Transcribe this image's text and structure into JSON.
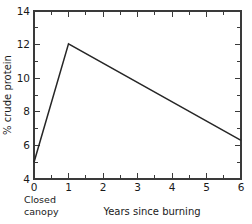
{
  "chart_data": {
    "type": "line",
    "title": "",
    "xlabel": "Years since burning",
    "ylabel": "% crude protein",
    "xlim": [
      0,
      6
    ],
    "ylim": [
      4,
      14
    ],
    "grid": false,
    "legend": null,
    "x": [
      0,
      1,
      6
    ],
    "values": [
      5.0,
      12.05,
      6.3
    ],
    "series": [
      {
        "name": "% crude protein",
        "points": [
          {
            "x": 0,
            "y": 5.0
          },
          {
            "x": 1,
            "y": 12.05
          },
          {
            "x": 6,
            "y": 6.3
          }
        ]
      }
    ],
    "x_ticks": [
      0,
      1,
      2,
      3,
      4,
      5,
      6
    ],
    "x_tick_labels": [
      "0",
      "1",
      "2",
      "3",
      "4",
      "5",
      "6"
    ],
    "x_minor_ticks": [
      0.5,
      1.5,
      2.5,
      3.5,
      4.5,
      5.5
    ],
    "y_ticks": [
      4,
      6,
      8,
      10,
      12,
      14
    ],
    "y_tick_labels": [
      "4",
      "6",
      "8",
      "10",
      "12",
      "14"
    ],
    "y_minor_ticks": [
      5,
      7,
      9,
      11,
      13
    ],
    "annotations": [
      {
        "text_line1": "Closed",
        "text_line2": "canopy",
        "at_x": 0
      }
    ],
    "line_color": "#262626",
    "axis_color": "#3a3a3a"
  },
  "labels": {
    "y_axis_title": "% crude protein",
    "x_axis_title": "Years since burning",
    "closed_line1": "Closed",
    "closed_line2": "canopy"
  }
}
